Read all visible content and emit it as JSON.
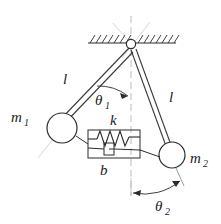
{
  "figure": {
    "kind": "mechanics-free-body-diagram",
    "background_color": "#ffffff",
    "stroke_color": "#2b2b2b",
    "construction_color": "#b0b0b0",
    "labels": {
      "mass_left": "m",
      "mass_left_sub": "1",
      "mass_right": "m",
      "mass_right_sub": "2",
      "rod_left_length": "l",
      "rod_right_length": "l",
      "angle_left": "θ",
      "angle_left_sub": "1",
      "angle_right": "θ",
      "angle_right_sub": "2",
      "spring": "k",
      "damper": "b"
    },
    "parts": {
      "ceiling": "hatched-fixed-support",
      "pivot": "revolute-joint",
      "rod_left": "rigid-link",
      "rod_right": "rigid-link",
      "bob_left": "point-mass-circle",
      "bob_right": "point-mass-circle",
      "spring_element": "coil-spring",
      "damper_element": "viscous-dashpot",
      "vertical_reference": "dashed-centerline",
      "arc_left": "angle-arc-arrow",
      "arc_right": "angle-arc-double-arrow"
    },
    "geometry": {
      "pivot_x": 131,
      "pivot_y": 44,
      "ceiling_y": 43,
      "ceiling_x_start": 88,
      "ceiling_x_end": 176,
      "bob_left_x": 62,
      "bob_left_y": 128,
      "bob_left_r": 15,
      "bob_right_x": 172,
      "bob_right_y": 155,
      "bob_right_r": 13,
      "box_x": 88,
      "box_y": 130,
      "box_w": 52,
      "box_h": 28
    }
  }
}
